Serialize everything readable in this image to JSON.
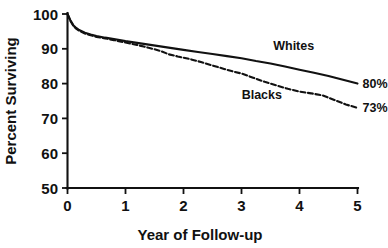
{
  "chart_data": {
    "type": "line",
    "title": "",
    "subtitle": "",
    "xlabel": "Year of Follow-up",
    "ylabel": "Percent Surviving",
    "xlim": [
      0,
      5
    ],
    "ylim": [
      50,
      100
    ],
    "xticks": [
      0,
      1,
      2,
      3,
      4,
      5
    ],
    "xtick_labels": [
      "0",
      "1",
      "2",
      "3",
      "4",
      "5"
    ],
    "yticks": [
      50,
      60,
      70,
      80,
      90,
      100
    ],
    "ytick_labels": [
      "50",
      "60",
      "70",
      "80",
      "90",
      "100"
    ],
    "grid": false,
    "legend_position": "inline-annotation",
    "series": [
      {
        "name": "Whites",
        "style": "solid",
        "end_label": "80%",
        "label_x": 3.9,
        "label_y": 89.6,
        "x": [
          0,
          0.05,
          0.1,
          0.15,
          0.2,
          0.3,
          0.4,
          0.5,
          0.65,
          0.8,
          1.0,
          1.2,
          1.4,
          1.6,
          1.8,
          2.0,
          2.25,
          2.5,
          2.75,
          3.0,
          3.25,
          3.5,
          3.75,
          4.0,
          4.25,
          4.5,
          4.75,
          5.0
        ],
        "y": [
          100,
          98.2,
          96.8,
          96.0,
          95.4,
          94.6,
          94.1,
          93.7,
          93.2,
          92.8,
          92.2,
          91.7,
          91.2,
          90.7,
          90.2,
          89.7,
          89.1,
          88.5,
          87.9,
          87.3,
          86.5,
          85.8,
          84.9,
          84.0,
          83.1,
          82.2,
          81.1,
          80.0
        ]
      },
      {
        "name": "Blacks",
        "style": "dashed",
        "end_label": "73%",
        "label_x": 3.35,
        "label_y": 75.6,
        "x": [
          0,
          0.05,
          0.1,
          0.15,
          0.2,
          0.3,
          0.4,
          0.5,
          0.65,
          0.8,
          1.0,
          1.2,
          1.4,
          1.6,
          1.75,
          1.9,
          2.1,
          2.3,
          2.5,
          2.7,
          2.85,
          3.0,
          3.2,
          3.4,
          3.6,
          3.8,
          4.0,
          4.2,
          4.4,
          4.6,
          4.8,
          5.0
        ],
        "y": [
          100,
          98.0,
          96.6,
          95.8,
          95.2,
          94.4,
          93.9,
          93.4,
          93.0,
          92.5,
          91.8,
          91.1,
          90.3,
          89.4,
          88.4,
          87.8,
          87.1,
          86.2,
          85.2,
          84.2,
          83.5,
          82.9,
          81.7,
          80.5,
          79.5,
          78.5,
          77.7,
          77.2,
          76.6,
          75.3,
          74.0,
          73.0
        ]
      }
    ]
  },
  "axes": {
    "y_title": "Percent Surviving",
    "x_title": "Year of Follow-up"
  },
  "annotations": {
    "whites_label": "Whites",
    "blacks_label": "Blacks",
    "whites_end": "80%",
    "blacks_end": "73%"
  },
  "colors": {
    "ink": "#111111",
    "background": "#ffffff"
  }
}
